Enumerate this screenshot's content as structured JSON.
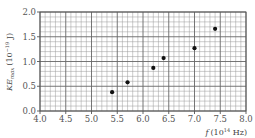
{
  "chart_data": {
    "type": "scatter",
    "title": "",
    "xlabel": "f (10^14 Hz)",
    "ylabel": "KE_max (10^-19 J)",
    "xlabel_parts": {
      "var": "f",
      "unit_pre": "(10",
      "exp": "14",
      "unit_post": " Hz)"
    },
    "ylabel_parts": {
      "var": "KE",
      "sub": "max",
      "unit_pre": "(10",
      "exp": "−19",
      "unit_post": " J)"
    },
    "xlim": [
      4.0,
      8.0
    ],
    "ylim": [
      0.0,
      2.0
    ],
    "x_ticks": [
      "4.0",
      "4.5",
      "5.0",
      "5.5",
      "6.0",
      "6.5",
      "7.0",
      "7.5",
      "8.0"
    ],
    "y_ticks": [
      "0.0",
      "0.5",
      "1.0",
      "1.5",
      "2.0"
    ],
    "grid": {
      "major_step_x": 0.5,
      "minor_step_x": 0.1,
      "major_step_y": 0.5,
      "minor_step_y": 0.1
    },
    "legend": null,
    "series": [
      {
        "name": "measurements",
        "x": [
          5.4,
          5.7,
          6.2,
          6.4,
          7.0,
          7.4
        ],
        "y": [
          0.38,
          0.58,
          0.87,
          1.07,
          1.27,
          1.66
        ]
      }
    ]
  }
}
